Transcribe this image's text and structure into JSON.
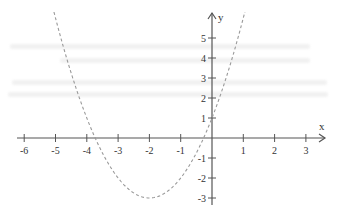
{
  "chart_data": {
    "type": "line",
    "title": "",
    "xlabel": "x",
    "ylabel": "y",
    "xlim": [
      -6.5,
      3.5
    ],
    "ylim": [
      -3.3,
      6.2
    ],
    "x_ticks": [
      -6,
      -5,
      -4,
      -3,
      -2,
      -1,
      1,
      2,
      3
    ],
    "x_tick_labels": [
      "-6",
      "-5",
      "-4",
      "-3",
      "-2",
      "-1",
      "1",
      "2",
      "3"
    ],
    "y_ticks": [
      -3,
      -2,
      -1,
      1,
      2,
      3,
      4,
      5
    ],
    "y_tick_labels": [
      "-3",
      "-2",
      "-1",
      "1",
      "2",
      "3",
      "4",
      "5"
    ],
    "grid": false,
    "series": [
      {
        "name": "y = (x+2)^2 - 3",
        "style": "dashed",
        "color": "#999999",
        "function": {
          "form": "a*(x-h)^2+k",
          "a": 1,
          "h": -2,
          "k": -3
        },
        "x_range": [
          -5.05,
          1.05
        ],
        "vertex": [
          -2,
          -3
        ],
        "roots": [
          -3.73,
          -0.27
        ]
      }
    ],
    "axis_color": "#555555"
  }
}
